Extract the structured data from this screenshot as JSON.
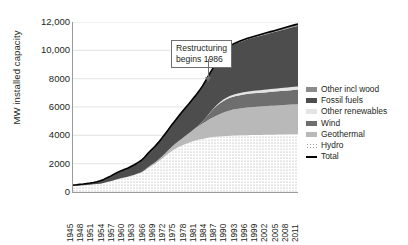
{
  "chart_data": {
    "type": "area",
    "title": "",
    "subtitle": "",
    "xlabel": "",
    "ylabel": "MW installed capacity",
    "stacked": true,
    "grid": true,
    "legend_position": "right",
    "ylim": [
      0,
      12000
    ],
    "xlim": [
      1945,
      2011
    ],
    "ytick_labels": [
      "12,000",
      "10,000",
      "8000",
      "6000",
      "4000",
      "2000",
      "0"
    ],
    "ytick_values": [
      12000,
      10000,
      8000,
      6000,
      4000,
      2000,
      0
    ],
    "xtick_labels": [
      "1945",
      "1948",
      "1951",
      "1954",
      "1957",
      "1960",
      "1963",
      "1966",
      "1969",
      "1972",
      "1975",
      "1978",
      "1981",
      "1984",
      "1987",
      "1990",
      "1993",
      "1996",
      "1999",
      "2002",
      "2005",
      "2008",
      "2011"
    ],
    "xtick_values": [
      1945,
      1948,
      1951,
      1954,
      1957,
      1960,
      1963,
      1966,
      1969,
      1972,
      1975,
      1978,
      1981,
      1984,
      1987,
      1990,
      1993,
      1996,
      1999,
      2002,
      2005,
      2008,
      2011
    ],
    "annotations": [
      {
        "text": "Restructuring begins 1986",
        "line1": "Restructuring",
        "line2": "begins 1986",
        "x": 1986,
        "points_to_y": 7600
      }
    ],
    "x": [
      1945,
      1946,
      1947,
      1948,
      1949,
      1950,
      1951,
      1952,
      1953,
      1954,
      1955,
      1956,
      1957,
      1958,
      1959,
      1960,
      1961,
      1962,
      1963,
      1964,
      1965,
      1966,
      1967,
      1968,
      1969,
      1970,
      1971,
      1972,
      1973,
      1974,
      1975,
      1976,
      1977,
      1978,
      1979,
      1980,
      1981,
      1982,
      1983,
      1984,
      1985,
      1986,
      1987,
      1988,
      1989,
      1990,
      1991,
      1992,
      1993,
      1994,
      1995,
      1996,
      1997,
      1998,
      1999,
      2000,
      2001,
      2002,
      2003,
      2004,
      2005,
      2006,
      2007,
      2008,
      2009,
      2010,
      2011
    ],
    "series": [
      {
        "name": "Hydro",
        "fill": "#ffffff",
        "pattern": "dotted",
        "values": [
          430,
          440,
          455,
          470,
          500,
          520,
          540,
          560,
          590,
          640,
          700,
          760,
          830,
          900,
          960,
          1010,
          1060,
          1130,
          1200,
          1280,
          1360,
          1500,
          1680,
          1840,
          1980,
          2150,
          2330,
          2520,
          2720,
          2900,
          3050,
          3180,
          3280,
          3380,
          3470,
          3560,
          3640,
          3700,
          3750,
          3800,
          3850,
          3880,
          3900,
          3920,
          3940,
          3960,
          3975,
          3985,
          3995,
          4000,
          4005,
          4010,
          4015,
          4020,
          4025,
          4030,
          4035,
          4040,
          4045,
          4050,
          4055,
          4060,
          4065,
          4070,
          4075,
          4080,
          4085
        ]
      },
      {
        "name": "Geothermal",
        "fill": "#b9b9b9",
        "pattern": "solid",
        "values": [
          0,
          0,
          0,
          0,
          0,
          0,
          0,
          0,
          0,
          0,
          0,
          0,
          0,
          0,
          10,
          12,
          14,
          18,
          22,
          30,
          40,
          55,
          72,
          90,
          110,
          135,
          165,
          200,
          240,
          290,
          350,
          420,
          500,
          590,
          680,
          780,
          880,
          980,
          1080,
          1180,
          1280,
          1380,
          1480,
          1570,
          1650,
          1720,
          1780,
          1830,
          1870,
          1900,
          1930,
          1950,
          1970,
          1985,
          1995,
          2005,
          2015,
          2025,
          2035,
          2045,
          2055,
          2065,
          2075,
          2085,
          2095,
          2105,
          2115
        ]
      },
      {
        "name": "Wind",
        "fill": "#6e6e6e",
        "pattern": "solid",
        "values": [
          0,
          0,
          0,
          0,
          0,
          0,
          0,
          0,
          0,
          0,
          0,
          0,
          0,
          0,
          0,
          0,
          0,
          0,
          0,
          0,
          0,
          0,
          0,
          0,
          0,
          0,
          0,
          0,
          0,
          0,
          0,
          0,
          0,
          0,
          0,
          5,
          20,
          60,
          140,
          280,
          420,
          560,
          680,
          760,
          820,
          860,
          890,
          910,
          925,
          935,
          945,
          955,
          960,
          965,
          970,
          975,
          980,
          985,
          990,
          995,
          1000,
          1005,
          1010,
          1015,
          1020,
          1025,
          1030
        ]
      },
      {
        "name": "Other renewables",
        "fill": "#e4e4e4",
        "pattern": "solid",
        "values": [
          0,
          0,
          0,
          0,
          0,
          0,
          0,
          0,
          0,
          0,
          0,
          0,
          0,
          0,
          0,
          0,
          0,
          0,
          0,
          0,
          0,
          0,
          0,
          0,
          0,
          0,
          0,
          0,
          0,
          0,
          0,
          0,
          0,
          0,
          0,
          0,
          0,
          0,
          0,
          0,
          10,
          25,
          45,
          70,
          95,
          115,
          130,
          142,
          150,
          156,
          160,
          164,
          168,
          172,
          176,
          180,
          184,
          188,
          192,
          196,
          200,
          204,
          208,
          212,
          216,
          220,
          224
        ]
      },
      {
        "name": "Fossil fuels",
        "fill": "#4d4d4d",
        "pattern": "solid",
        "values": [
          60,
          70,
          80,
          90,
          100,
          110,
          130,
          160,
          200,
          250,
          300,
          360,
          420,
          470,
          520,
          560,
          600,
          650,
          700,
          760,
          820,
          900,
          980,
          1050,
          1120,
          1200,
          1290,
          1380,
          1460,
          1550,
          1650,
          1760,
          1880,
          1980,
          2080,
          2180,
          2280,
          2400,
          2520,
          2640,
          2760,
          2880,
          3100,
          3250,
          3350,
          3420,
          3480,
          3520,
          3560,
          3600,
          3640,
          3680,
          3720,
          3760,
          3800,
          3840,
          3880,
          3920,
          3960,
          4000,
          4040,
          4080,
          4120,
          4160,
          4200,
          4240,
          4280
        ]
      },
      {
        "name": "Other incl wood",
        "fill": "#8c8c8c",
        "pattern": "solid",
        "values": [
          0,
          0,
          0,
          0,
          0,
          0,
          0,
          0,
          0,
          0,
          0,
          0,
          0,
          0,
          0,
          0,
          0,
          0,
          0,
          0,
          0,
          0,
          0,
          0,
          0,
          0,
          0,
          0,
          0,
          0,
          0,
          0,
          0,
          0,
          0,
          0,
          0,
          0,
          0,
          0,
          0,
          0,
          10,
          20,
          30,
          40,
          48,
          54,
          58,
          62,
          66,
          70,
          74,
          78,
          82,
          86,
          90,
          94,
          98,
          102,
          106,
          110,
          114,
          118,
          122,
          126,
          130
        ]
      }
    ],
    "total_line": {
      "name": "Total",
      "color": "#000000",
      "values": [
        490,
        510,
        535,
        560,
        600,
        630,
        670,
        720,
        790,
        890,
        1000,
        1120,
        1250,
        1370,
        1490,
        1582,
        1674,
        1798,
        1922,
        2070,
        2220,
        2455,
        2732,
        2980,
        3210,
        3485,
        3785,
        4100,
        4420,
        4740,
        5050,
        5360,
        5660,
        5950,
        6230,
        6525,
        6820,
        7140,
        7490,
        7900,
        8320,
        8725,
        9170,
        9590,
        9885,
        10115,
        10303,
        10441,
        10558,
        10653,
        10746,
        10829,
        10907,
        10980,
        11048,
        11116,
        11184,
        11252,
        11320,
        11388,
        11456,
        11524,
        11592,
        11660,
        11728,
        11796,
        11864
      ]
    }
  },
  "legend": {
    "items": [
      {
        "label": "Other incl wood",
        "swatch": "#8c8c8c",
        "kind": "area"
      },
      {
        "label": "Fossil fuels",
        "swatch": "#4d4d4d",
        "kind": "area"
      },
      {
        "label": "Other renewables",
        "swatch": "#e4e4e4",
        "kind": "area"
      },
      {
        "label": "Wind",
        "swatch": "#6e6e6e",
        "kind": "area"
      },
      {
        "label": "Geothermal",
        "swatch": "#b9b9b9",
        "kind": "area"
      },
      {
        "label": "Hydro",
        "swatch": "#f2f2f2",
        "kind": "area"
      },
      {
        "label": "Total",
        "swatch": "#000000",
        "kind": "line"
      }
    ]
  }
}
